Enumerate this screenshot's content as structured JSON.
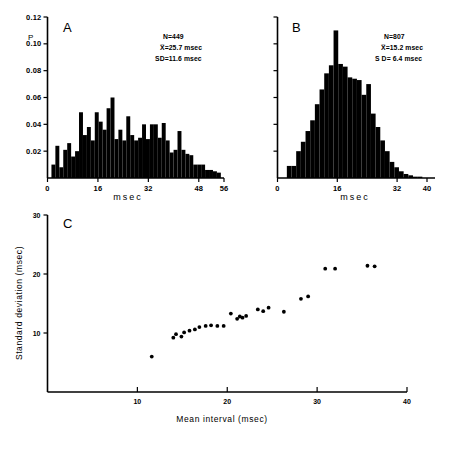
{
  "figure": {
    "panels": [
      "A",
      "B",
      "C"
    ]
  },
  "panelA": {
    "label": "A",
    "ylabel": "P",
    "xlabel": "msec",
    "yticks": [
      "0.02",
      "0.04",
      "0.06",
      "0.08",
      "0.10",
      "0.12"
    ],
    "ytick_values": [
      0.02,
      0.04,
      0.06,
      0.08,
      0.1,
      0.12
    ],
    "xticks": [
      "0",
      "16",
      "32",
      "48",
      "56"
    ],
    "xtick_values": [
      0,
      16,
      32,
      48,
      56
    ],
    "stats": {
      "n": "N=449",
      "mean": "X̅=25.7 msec",
      "sd": "SD=11.6 msec"
    }
  },
  "panelB": {
    "label": "B",
    "xlabel": "msec",
    "xticks": [
      "0",
      "16",
      "32",
      "40"
    ],
    "xtick_values": [
      0,
      16,
      32,
      40
    ],
    "ytick_values": [
      0.02,
      0.04,
      0.06,
      0.08,
      0.1,
      0.12
    ],
    "stats": {
      "n": "N=807",
      "mean": "X̅=15.2 msec",
      "sd": "S D=  6.4 msec"
    }
  },
  "panelC": {
    "label": "C",
    "ylabel": "Standard  deviation  (msec)",
    "xlabel": "Mean  interval  (msec)",
    "yticks": [
      "10",
      "20",
      "30"
    ],
    "ytick_values": [
      10,
      20,
      30
    ],
    "xticks": [
      "10",
      "20",
      "30",
      "40"
    ],
    "xtick_values": [
      10,
      20,
      30,
      40
    ]
  },
  "chart_data": [
    {
      "type": "bar",
      "panel": "A",
      "title": "",
      "xlabel": "msec",
      "ylabel": "P",
      "xlim": [
        0,
        56
      ],
      "ylim": [
        0,
        0.12
      ],
      "bin_width": 1.25,
      "grid": false,
      "legend": "none",
      "annotations": [
        "N=449",
        "X̅=25.7 msec",
        "SD=11.6 msec"
      ],
      "bin_starts": [
        1.25,
        2.5,
        3.75,
        5,
        6.25,
        7.5,
        8.75,
        10,
        11.25,
        12.5,
        13.75,
        15,
        16.25,
        17.5,
        18.75,
        20,
        21.25,
        22.5,
        23.75,
        25,
        26.25,
        27.5,
        28.75,
        30,
        31.25,
        32.5,
        33.75,
        35,
        36.25,
        37.5,
        38.75,
        40,
        41.25,
        42.5,
        43.75,
        45,
        46.25,
        47.5,
        48.75,
        50,
        51.25,
        52.5,
        53.75
      ],
      "values": [
        0.01,
        0.024,
        0.008,
        0.021,
        0.026,
        0.016,
        0.02,
        0.049,
        0.032,
        0.038,
        0.028,
        0.049,
        0.042,
        0.036,
        0.052,
        0.06,
        0.029,
        0.036,
        0.028,
        0.046,
        0.032,
        0.028,
        0.03,
        0.04,
        0.029,
        0.04,
        0.04,
        0.03,
        0.041,
        0.028,
        0.019,
        0.021,
        0.035,
        0.021,
        0.018,
        0.017,
        0.01,
        0.01,
        0.01,
        0.006,
        0.006,
        0.005,
        0.004
      ]
    },
    {
      "type": "bar",
      "panel": "B",
      "title": "",
      "xlabel": "msec",
      "ylabel": "",
      "xlim": [
        0,
        40
      ],
      "ylim": [
        0,
        0.12
      ],
      "bin_width": 1.25,
      "grid": false,
      "legend": "none",
      "annotations": [
        "N=807",
        "X̅=15.2 msec",
        "S D=  6.4 msec"
      ],
      "bin_starts": [
        2.5,
        3.75,
        5,
        6.25,
        7.5,
        8.75,
        10,
        11.25,
        12.5,
        13.75,
        15,
        16.25,
        17.5,
        18.75,
        20,
        21.25,
        22.5,
        23.75,
        25,
        26.25,
        27.5,
        28.75,
        30,
        31.25,
        32.5,
        33.75,
        35,
        36.25,
        37.5
      ],
      "values": [
        0.009,
        0.009,
        0.02,
        0.027,
        0.035,
        0.043,
        0.055,
        0.066,
        0.078,
        0.084,
        0.11,
        0.085,
        0.083,
        0.075,
        0.074,
        0.073,
        0.062,
        0.07,
        0.048,
        0.038,
        0.028,
        0.02,
        0.012,
        0.008,
        0.005,
        0.003,
        0.002,
        0.001,
        0.001
      ]
    },
    {
      "type": "scatter",
      "panel": "C",
      "title": "",
      "xlabel": "Mean  interval  (msec)",
      "ylabel": "Standard  deviation  (msec)",
      "xlim": [
        0,
        40
      ],
      "ylim": [
        0,
        30
      ],
      "grid": false,
      "legend": "none",
      "points": [
        {
          "x": 11.6,
          "y": 6.0
        },
        {
          "x": 14.0,
          "y": 9.2
        },
        {
          "x": 14.3,
          "y": 9.8
        },
        {
          "x": 14.9,
          "y": 9.4
        },
        {
          "x": 15.2,
          "y": 10.1
        },
        {
          "x": 15.8,
          "y": 10.4
        },
        {
          "x": 16.4,
          "y": 10.6
        },
        {
          "x": 16.9,
          "y": 11.0
        },
        {
          "x": 17.6,
          "y": 11.2
        },
        {
          "x": 18.2,
          "y": 11.3
        },
        {
          "x": 18.9,
          "y": 11.2
        },
        {
          "x": 19.6,
          "y": 11.2
        },
        {
          "x": 20.4,
          "y": 13.3
        },
        {
          "x": 21.1,
          "y": 12.4
        },
        {
          "x": 21.4,
          "y": 12.8
        },
        {
          "x": 21.7,
          "y": 12.6
        },
        {
          "x": 22.1,
          "y": 12.9
        },
        {
          "x": 23.4,
          "y": 14.0
        },
        {
          "x": 24.0,
          "y": 13.7
        },
        {
          "x": 24.6,
          "y": 14.3
        },
        {
          "x": 26.3,
          "y": 13.6
        },
        {
          "x": 28.2,
          "y": 15.8
        },
        {
          "x": 29.0,
          "y": 16.2
        },
        {
          "x": 30.9,
          "y": 20.9
        },
        {
          "x": 32.0,
          "y": 20.9
        },
        {
          "x": 35.6,
          "y": 21.4
        },
        {
          "x": 36.4,
          "y": 21.3
        }
      ]
    }
  ]
}
